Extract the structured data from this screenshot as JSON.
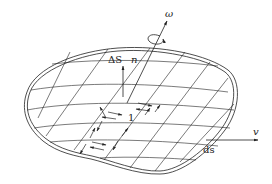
{
  "diagram": {
    "labels": {
      "omega": "ω",
      "delta_s": "ΔS",
      "normal": "n",
      "cell": "1",
      "velocity": "v",
      "ds": "ds"
    },
    "colors": {
      "line": "#222222",
      "background": "#ffffff"
    }
  }
}
